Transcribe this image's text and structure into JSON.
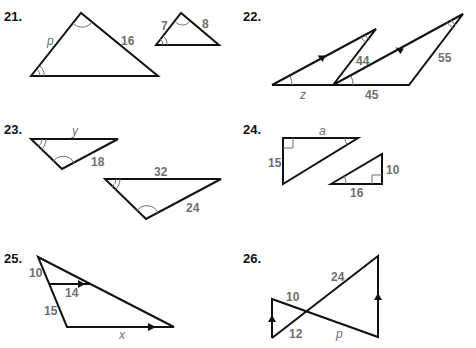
{
  "problems": [
    {
      "number": "21.",
      "labels": {
        "left_side": "p",
        "right_side": "16",
        "small_left": "7",
        "small_right": "8"
      }
    },
    {
      "number": "22.",
      "labels": {
        "base_left": "z",
        "middle_side": "44",
        "base_right": "45",
        "right_side": "55"
      }
    },
    {
      "number": "23.",
      "labels": {
        "top1": "y",
        "side1": "18",
        "top2": "32",
        "side2": "24"
      }
    },
    {
      "number": "24.",
      "labels": {
        "top": "a",
        "left": "15",
        "right": "10",
        "bottom": "16"
      }
    },
    {
      "number": "25.",
      "labels": {
        "upper_left": "10",
        "inner": "14",
        "lower_left": "15",
        "base": "x"
      }
    },
    {
      "number": "26.",
      "labels": {
        "left_upper": "10",
        "right_upper": "24",
        "left_lower": "12",
        "right_lower": "p"
      }
    }
  ],
  "colors": {
    "line": "#111111",
    "label": "#6f6f6f",
    "background": "#ffffff"
  }
}
